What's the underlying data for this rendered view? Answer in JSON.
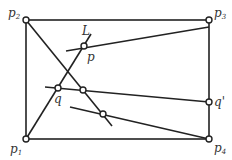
{
  "diagram": {
    "points": {
      "p1": {
        "label": "p",
        "sub": "1",
        "x": 26,
        "y": 139
      },
      "p2": {
        "label": "p",
        "sub": "2",
        "x": 26,
        "y": 20
      },
      "p3": {
        "label": "p",
        "sub": "3",
        "x": 209,
        "y": 20
      },
      "p4": {
        "label": "p",
        "sub": "4",
        "x": 209,
        "y": 139
      },
      "p": {
        "label": "p",
        "x": 84,
        "y": 46
      },
      "q": {
        "label": "q",
        "x": 58,
        "y": 88
      },
      "q_prime": {
        "label": "q'",
        "x": 209,
        "y": 102
      },
      "mid": {
        "x": 83,
        "y": 90
      },
      "low": {
        "x": 103,
        "y": 114
      }
    },
    "line_label": "L",
    "stroke_color": "#222222"
  }
}
